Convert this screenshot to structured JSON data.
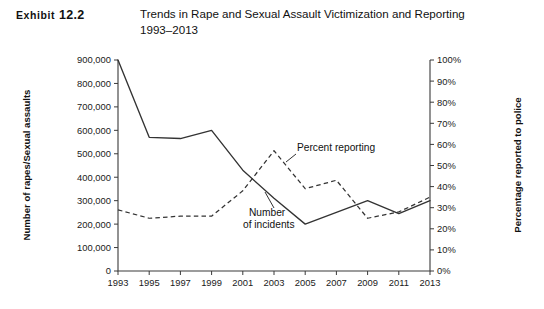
{
  "exhibit": {
    "prefix": "Exhibit",
    "number": "12.2"
  },
  "title": {
    "line1": "Trends in Rape and Sexual Assault Victimization and Reporting",
    "line2": "1993–2013"
  },
  "axes": {
    "left_title": "Number of rapes/Sexual assaults",
    "right_title": "Percentage reported to police",
    "left_ticks": [
      "0",
      "100,000",
      "200,000",
      "300,000",
      "400,000",
      "500,000",
      "600,000",
      "700,000",
      "800,000",
      "900,000"
    ],
    "right_ticks": [
      "0%",
      "10%",
      "20%",
      "30%",
      "40%",
      "50%",
      "60%",
      "70%",
      "80%",
      "90%",
      "100%"
    ],
    "x_ticks": [
      "1993",
      "1995",
      "1997",
      "1999",
      "2001",
      "2003",
      "2005",
      "2007",
      "2009",
      "2011",
      "2013"
    ]
  },
  "annotations": {
    "percent_reporting": "Percent reporting",
    "number_of_incidents_line1": "Number",
    "number_of_incidents_line2": "of incidents"
  },
  "chart_data": {
    "type": "line",
    "title": "Trends in Rape and Sexual Assault Victimization and Reporting 1993–2013",
    "xlabel": "",
    "ylabel": "Number of rapes/Sexual assaults",
    "y2label": "Percentage reported to police",
    "x": [
      1993,
      1995,
      1997,
      1999,
      2001,
      2003,
      2005,
      2007,
      2009,
      2011,
      2013
    ],
    "xlim": [
      1993,
      2013
    ],
    "ylim": [
      0,
      900000
    ],
    "y2lim": [
      0,
      100
    ],
    "grid": false,
    "legend": "inline-annotations",
    "series": [
      {
        "name": "Number of incidents",
        "axis": "left",
        "style": "solid",
        "units": "rapes/sexual assaults",
        "values": [
          900000,
          570000,
          565000,
          600000,
          430000,
          310000,
          200000,
          250000,
          300000,
          245000,
          300000
        ]
      },
      {
        "name": "Percent reporting",
        "axis": "right",
        "style": "dashed",
        "units": "percent reported to police",
        "values": [
          29,
          25,
          26,
          26,
          38,
          57,
          39,
          43,
          25,
          28,
          35
        ]
      }
    ]
  }
}
